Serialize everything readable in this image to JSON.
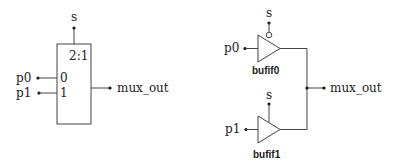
{
  "mux_diagram": {
    "select_label": "s",
    "ratio_label": "2:1",
    "inputs": [
      {
        "name": "p0",
        "pin": "0"
      },
      {
        "name": "p1",
        "pin": "1"
      }
    ],
    "output_label": "mux_out"
  },
  "bufif_diagram": {
    "buffers": [
      {
        "name": "bufif0",
        "input": "p0",
        "enable": "s",
        "enable_inverted": true
      },
      {
        "name": "bufif1",
        "input": "p1",
        "enable": "s",
        "enable_inverted": false
      }
    ],
    "output_label": "mux_out"
  }
}
